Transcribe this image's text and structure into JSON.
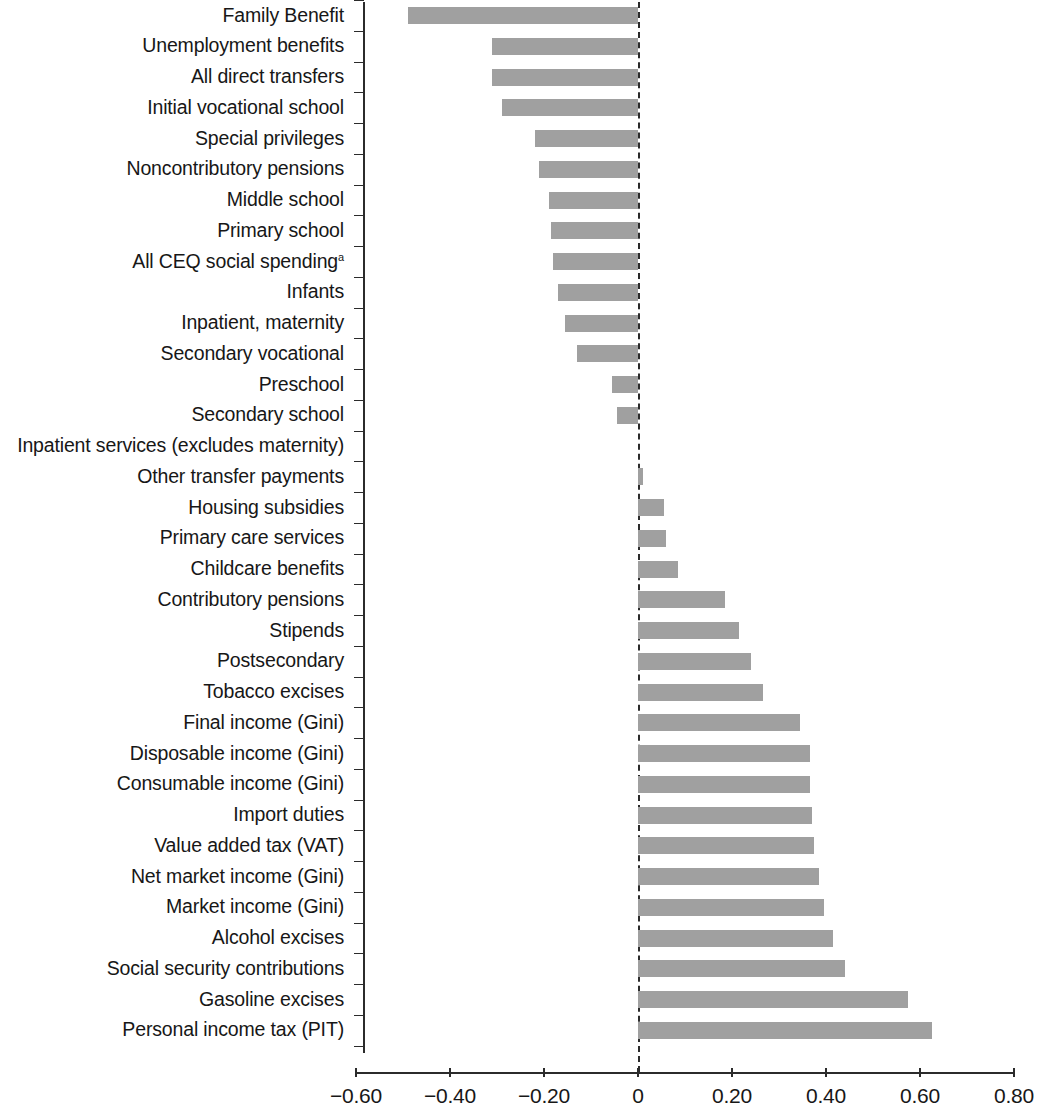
{
  "chart_data": {
    "type": "bar",
    "orientation": "horizontal",
    "title": "",
    "subtitle": "",
    "xlabel": "",
    "ylabel": "",
    "xlim": [
      -0.6,
      0.8
    ],
    "xticks": [
      -0.6,
      -0.4,
      -0.2,
      0,
      0.2,
      0.4,
      0.6,
      0.8
    ],
    "xtick_labels": [
      "−0.60",
      "−0.40",
      "−0.20",
      "0",
      "0.20",
      "0.40",
      "0.60",
      "0.80"
    ],
    "grid": false,
    "legend": null,
    "zero_reference_line": true,
    "bar_color": "#a0a0a0",
    "axis_color": "#2b2b2b",
    "footnote_marker": "a",
    "categories": [
      "Family Benefit",
      "Unemployment benefits",
      "All direct transfers",
      "Initial vocational school",
      "Special privileges",
      "Noncontributory pensions",
      "Middle school",
      "Primary school",
      "All CEQ social spending",
      "Infants",
      "Inpatient, maternity",
      "Secondary vocational",
      "Preschool",
      "Secondary school",
      "Inpatient services (excludes maternity)",
      "Other transfer payments",
      "Housing subsidies",
      "Primary care services",
      "Childcare benefits",
      "Contributory pensions",
      "Stipends",
      "Postsecondary",
      "Tobacco excises",
      "Final income (Gini)",
      "Disposable income (Gini)",
      "Consumable income (Gini)",
      "Import duties",
      "Value added tax (VAT)",
      "Net market income (Gini)",
      "Market income (Gini)",
      "Alcohol excises",
      "Social security contributions",
      "Gasoline excises",
      "Personal income  tax (PIT)"
    ],
    "category_superscripts": {
      "All CEQ social spending": "a"
    },
    "values": [
      -0.49,
      -0.31,
      -0.31,
      -0.29,
      -0.22,
      -0.21,
      -0.19,
      -0.185,
      -0.18,
      -0.17,
      -0.155,
      -0.13,
      -0.055,
      -0.045,
      0.0,
      0.01,
      0.055,
      0.06,
      0.085,
      0.185,
      0.215,
      0.24,
      0.265,
      0.345,
      0.365,
      0.365,
      0.37,
      0.375,
      0.385,
      0.395,
      0.415,
      0.44,
      0.575,
      0.625
    ]
  }
}
